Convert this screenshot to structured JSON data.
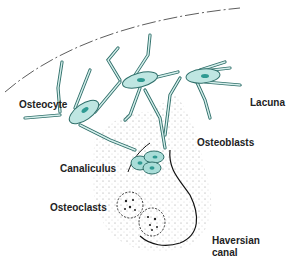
{
  "diagram": {
    "labels": {
      "osteocyte": "Osteocyte",
      "lacuna": "Lacuna",
      "osteoblasts": "Osteoblasts",
      "canaliculus": "Canaliculus",
      "osteoclasts": "Osteoclasts",
      "haversian_line1": "Haversian",
      "haversian_line2": "canal"
    },
    "colors": {
      "cell_fill": "#bfe6e2",
      "cell_stroke": "#2f6f6a",
      "nucleus": "#2f9a92",
      "outline": "#1a1a1a",
      "stipple": "#555555"
    }
  }
}
